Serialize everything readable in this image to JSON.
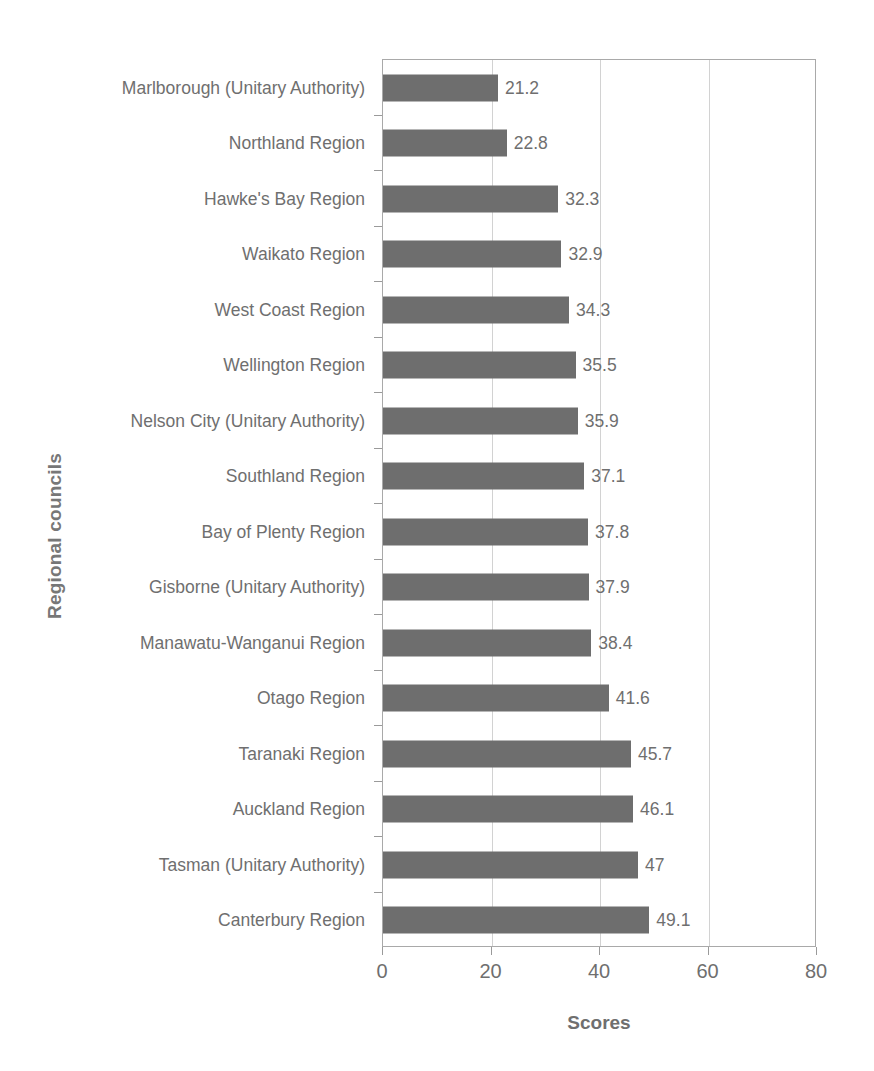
{
  "chart_data": {
    "type": "bar",
    "orientation": "horizontal",
    "title": "",
    "xlabel": "Scores",
    "ylabel": "Regional councils",
    "xlim": [
      0,
      80
    ],
    "xticks": [
      0,
      20,
      40,
      60,
      80
    ],
    "xtick_labels": [
      "0",
      "20",
      "40",
      "60",
      "80"
    ],
    "grid": "vertical",
    "legend": "none",
    "bar_color": "#6e6e6e",
    "text_color": "#6f6f6f",
    "axis_color": "#a9a9a9",
    "gridline_color": "#d2d2d2",
    "categories": [
      "Marlborough (Unitary Authority)",
      "Northland Region",
      "Hawke's Bay Region",
      "Waikato Region",
      "West Coast Region",
      "Wellington Region",
      "Nelson City (Unitary Authority)",
      "Southland Region",
      "Bay of Plenty Region",
      "Gisborne (Unitary Authority)",
      "Manawatu-Wanganui Region",
      "Otago Region",
      "Taranaki Region",
      "Auckland Region",
      "Tasman (Unitary Authority)",
      "Canterbury Region"
    ],
    "values": [
      21.2,
      22.8,
      32.3,
      32.9,
      34.3,
      35.5,
      35.9,
      37.1,
      37.8,
      37.9,
      38.4,
      41.6,
      45.7,
      46.1,
      47,
      49.1
    ],
    "value_labels": [
      "21.2",
      "22.8",
      "32.3",
      "32.9",
      "34.3",
      "35.5",
      "35.9",
      "37.1",
      "37.8",
      "37.9",
      "38.4",
      "41.6",
      "45.7",
      "46.1",
      "47",
      "49.1"
    ]
  }
}
